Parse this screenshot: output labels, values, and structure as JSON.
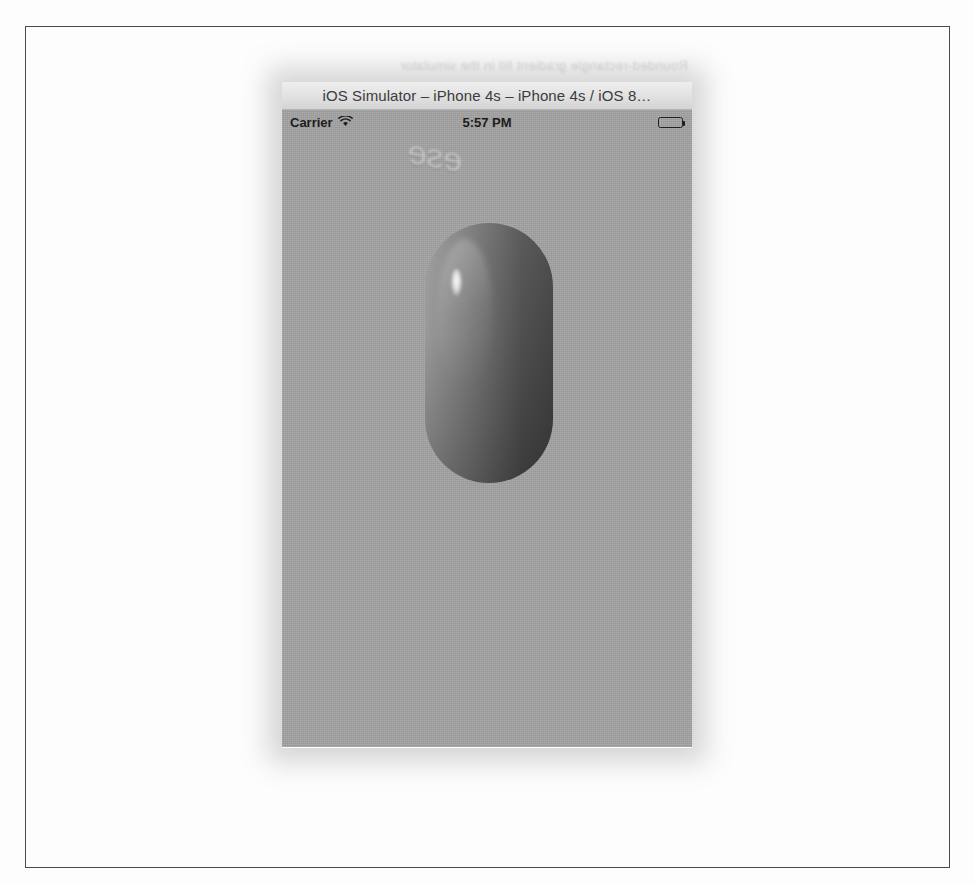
{
  "figure": {
    "border_color": "#4a4a4a",
    "page_background": "#fdfdfd",
    "bleed_through_line": "Rounded-rectangle gradient fill in the simulator",
    "bleed_through_scribble": "ese"
  },
  "window": {
    "title": "iOS Simulator – iPhone 4s – iPhone 4s / iOS 8…",
    "titlebar_color": "#e2e2e2",
    "device": "iPhone 4s",
    "os_version": "iOS 8"
  },
  "status_bar": {
    "carrier": "Carrier",
    "wifi_icon": "wifi-icon",
    "time": "5:57 PM",
    "battery_icon": "battery-full-icon",
    "battery_level": "100"
  },
  "screen": {
    "background_color": "#a2a2a2"
  },
  "shape": {
    "name": "rounded-rectangle",
    "corner_radius": "64",
    "width": "128",
    "height": "260",
    "gradient_start_color": "#9a9a9a",
    "gradient_end_color": "#444444",
    "highlight": "specular-highlight"
  }
}
